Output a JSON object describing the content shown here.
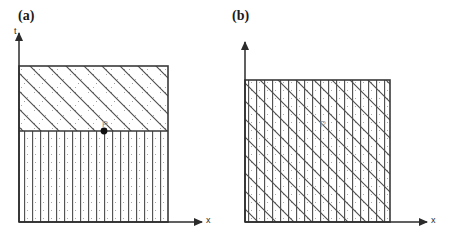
{
  "figure": {
    "type": "diagram",
    "background_color": "#ffffff",
    "line_color": "#3a3a3a",
    "hatch_color": "#4a4a4a",
    "stipple_color": "#9a9a9a",
    "label_color": "#1a1a1a",
    "point_color": "#111111",
    "point_label_color": "#9a9a9a"
  },
  "panels": [
    {
      "id": "panel-a",
      "label": "(a)",
      "label_x": 18,
      "label_y": 8,
      "axes": {
        "t_label": "t",
        "t_label_x": 14,
        "t_label_y": 26,
        "x_label": "x",
        "x_label_x": 206,
        "x_label_y": 215,
        "origin_x": 19,
        "origin_y": 222,
        "t_axis_top_y": 33,
        "x_axis_right_x": 202
      },
      "square": {
        "left": 19,
        "top": 66,
        "right": 168,
        "bottom": 222
      },
      "divider_y": 131,
      "regions": [
        {
          "name": "upper-region",
          "fill": "diagonal-hatch-stipple",
          "from_y": 66,
          "to_y": 131
        },
        {
          "name": "lower-region",
          "fill": "vertical-hatch-stipple",
          "from_y": 131,
          "to_y": 222
        }
      ],
      "point": {
        "label": "P",
        "x": 104,
        "y": 131,
        "marker": "filled-circle",
        "marker_radius": 3.4,
        "label_dx": -2,
        "label_dy": -12,
        "has_marker": true
      }
    },
    {
      "id": "panel-b",
      "label": "(b)",
      "label_x": 232,
      "label_y": 8,
      "axes": {
        "t_label": "t",
        "t_label_x": 240,
        "t_label_y": 26,
        "x_label": "x",
        "x_label_x": 431,
        "x_label_y": 215,
        "origin_x": 245,
        "origin_y": 222,
        "t_axis_top_y": 42,
        "x_axis_right_x": 427
      },
      "square": {
        "left": 245,
        "top": 80,
        "right": 390,
        "bottom": 222
      },
      "divider_y": null,
      "regions": [
        {
          "name": "full-region",
          "fill": "crossed-vertical-diagonal-stipple",
          "from_y": 80,
          "to_y": 222
        }
      ],
      "point": {
        "label": "P",
        "x": 323,
        "y": 124,
        "marker": "none",
        "marker_radius": 0,
        "label_dx": -3,
        "label_dy": 3,
        "has_marker": false
      }
    }
  ],
  "patterns": {
    "vertical_spacing": 8,
    "diagonal_spacing": 18,
    "diagonal_angle_deg": -45,
    "stipple_spacing": 13
  }
}
